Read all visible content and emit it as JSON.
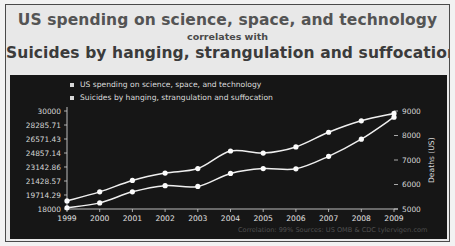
{
  "title": {
    "line1": "US spending on science, space, and technology",
    "line2": "correlates with",
    "line3": "Suicides by hanging, strangulation and suffocation"
  },
  "footnote": "Correlation: 99%   Sources: US OMB & CDC   tylervigen.com",
  "chart_data": {
    "type": "line",
    "title": "US spending on science, space, and technology correlates with Suicides by hanging, strangulation and suffocation",
    "xlabel": "",
    "ylabel": "",
    "y2label": "Deaths (US)",
    "grid": false,
    "legend_position": "top-left",
    "categories": [
      "1999",
      "2000",
      "2001",
      "2002",
      "2003",
      "2004",
      "2005",
      "2006",
      "2007",
      "2008",
      "2009"
    ],
    "ylim": [
      18000,
      30000
    ],
    "y2lim": [
      5000,
      9000
    ],
    "yticks": [
      "18000",
      "19714.29",
      "21428.57",
      "23142.86",
      "24857.14",
      "26571.43",
      "28285.71",
      "30000"
    ],
    "ytick_values": [
      18000,
      19714.29,
      21428.57,
      23142.86,
      24857.14,
      26571.43,
      28285.71,
      30000
    ],
    "y2ticks": [
      "5000",
      "6000",
      "7000",
      "8000",
      "9000"
    ],
    "y2tick_values": [
      5000,
      6000,
      7000,
      8000,
      9000
    ],
    "series": [
      {
        "name": "US spending on science, space, and technology",
        "axis": "left",
        "values": [
          18990,
          20100,
          21500,
          22400,
          22950,
          25100,
          24850,
          25600,
          27400,
          28800,
          29700
        ]
      },
      {
        "name": "Suicides by hanging, strangulation and suffocation",
        "axis": "right",
        "values": [
          5050,
          5250,
          5700,
          5950,
          5920,
          6450,
          6650,
          6640,
          7150,
          7850,
          8750
        ]
      }
    ]
  }
}
